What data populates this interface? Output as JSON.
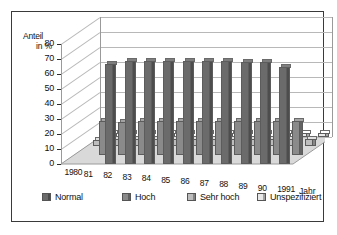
{
  "chart_data": {
    "type": "bar",
    "title": "",
    "subtitle": "",
    "xlabel": "Jahr",
    "ylabel": "Anteil in %",
    "ylabel_line1": "Anteil",
    "ylabel_line2": "in %",
    "ylim": [
      0,
      80
    ],
    "yticks": [
      0,
      10,
      20,
      30,
      40,
      50,
      60,
      70,
      80
    ],
    "grid": true,
    "legend_position": "bottom",
    "projection": "3d-depth-rows",
    "categories": [
      "1980",
      "81",
      "82",
      "83",
      "84",
      "85",
      "86",
      "87",
      "88",
      "89",
      "90",
      "1991"
    ],
    "series": [
      {
        "name": "Normal",
        "color": "#6b6b6b",
        "values": [
          0,
          0,
          67,
          69,
          69,
          69,
          69,
          69,
          69,
          68,
          68,
          65
        ]
      },
      {
        "name": "Hoch",
        "color": "#8a8a8a",
        "values": [
          0,
          23,
          22,
          23,
          23,
          23,
          23,
          23,
          23,
          23,
          23,
          23
        ]
      },
      {
        "name": "Sehr hoch",
        "color": "#bdbdbd",
        "values": [
          4,
          5,
          5,
          5,
          5,
          5,
          5,
          5,
          5,
          5,
          5,
          5
        ]
      },
      {
        "name": "Unspezifiziert",
        "color": "#e8e8e8",
        "values": [
          3,
          3,
          3,
          3,
          3,
          3,
          3,
          3,
          3,
          3,
          3,
          3
        ]
      }
    ]
  },
  "legend": {
    "items": [
      {
        "label": "Normal"
      },
      {
        "label": "Hoch"
      },
      {
        "label": "Sehr hoch"
      },
      {
        "label": "Unspezifiziert"
      }
    ]
  },
  "colors": {
    "border": "#3a3a3a",
    "grid": "#b8b8b8",
    "axis": "#2e2e2e",
    "floor": "#d9d9d9",
    "text": "#111111"
  }
}
